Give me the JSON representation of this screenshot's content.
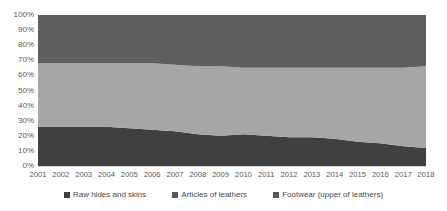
{
  "chart_data": {
    "type": "area",
    "stacked": "100%",
    "title": "",
    "subtitle": "",
    "xlabel": "",
    "ylabel": "",
    "ylim": [
      0,
      100
    ],
    "y_unit": "%",
    "grid": false,
    "legend_position": "bottom",
    "categories": [
      "2001",
      "2002",
      "2003",
      "2004",
      "2005",
      "2006",
      "2007",
      "2008",
      "2009",
      "2010",
      "2011",
      "2012",
      "2013",
      "2014",
      "2015",
      "2016",
      "2017",
      "2018"
    ],
    "x": [
      2001,
      2002,
      2003,
      2004,
      2005,
      2006,
      2007,
      2008,
      2009,
      2010,
      2011,
      2012,
      2013,
      2014,
      2015,
      2016,
      2017,
      2018
    ],
    "y_ticks": [
      "0%",
      "10%",
      "20%",
      "30%",
      "40%",
      "50%",
      "60%",
      "70%",
      "80%",
      "90%",
      "100%"
    ],
    "y_tick_values": [
      0,
      10,
      20,
      30,
      40,
      50,
      60,
      70,
      80,
      90,
      100
    ],
    "series": [
      {
        "name": "Raw hides and skins",
        "color": "#404040",
        "values": [
          26,
          26,
          26,
          26,
          25,
          24,
          23,
          21,
          20,
          21,
          20,
          19,
          19,
          18,
          16,
          15,
          13,
          12
        ]
      },
      {
        "name": "Articles of leathers",
        "color": "#a6a6a6",
        "values": [
          42,
          42,
          42,
          42,
          43,
          44,
          44,
          45,
          46,
          44,
          45,
          46,
          46,
          47,
          49,
          50,
          52,
          54
        ]
      },
      {
        "name": "Footwear (upper of leathers)",
        "color": "#5f5f5f",
        "values": [
          32,
          32,
          32,
          32,
          32,
          32,
          33,
          34,
          34,
          35,
          35,
          35,
          35,
          35,
          35,
          35,
          35,
          34
        ]
      }
    ],
    "cumulative_upper_bounds": {
      "raw_hides_and_skins": [
        26,
        26,
        26,
        26,
        25,
        24,
        23,
        21,
        20,
        21,
        20,
        19,
        19,
        18,
        16,
        15,
        13,
        12
      ],
      "articles_of_leathers": [
        68,
        68,
        68,
        68,
        68,
        68,
        67,
        66,
        66,
        65,
        65,
        65,
        65,
        65,
        65,
        65,
        65,
        66
      ]
    }
  },
  "legend": {
    "items": [
      {
        "label": "Raw hides and skins",
        "color": "#404040"
      },
      {
        "label": "Articles of leathers",
        "color": "#595959"
      },
      {
        "label": "Footwear (upper of leathers)",
        "color": "#595959"
      }
    ]
  },
  "colors": {
    "background": "#ffffff",
    "axis_line": "#d9d9d9",
    "tick_label": "#595959",
    "legend_text": "#4a4a4a",
    "band_bottom": "#404040",
    "band_middle": "#a6a6a6",
    "band_top": "#5f5f5f"
  }
}
